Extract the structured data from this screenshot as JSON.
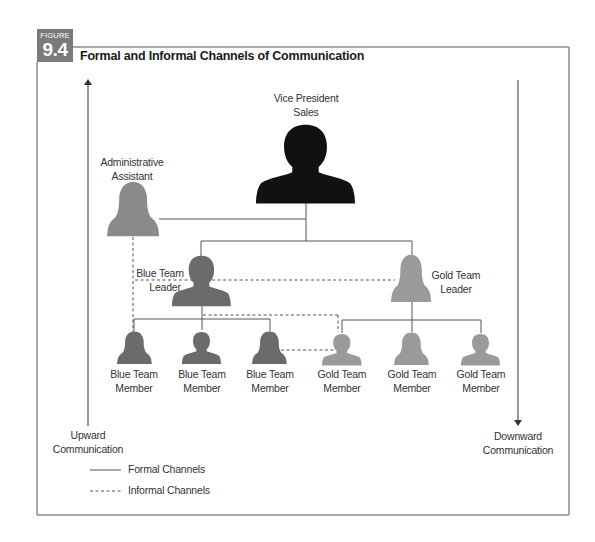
{
  "figure": {
    "label": "FIGURE",
    "number": "9.4",
    "title": "Formal and Informal Channels of Communication"
  },
  "colors": {
    "vp": "#111111",
    "blue_team": "#6b6b6b",
    "gold_team": "#9a9a9a",
    "admin": "#8a8a8a",
    "badge": "#7a7a7a",
    "frame": "#8c8c8c",
    "line": "#555555"
  },
  "nodes": {
    "vp": {
      "line1": "Vice President",
      "line2": "Sales"
    },
    "admin": {
      "line1": "Administrative",
      "line2": "Assistant"
    },
    "blue_leader": {
      "line1": "Blue Team",
      "line2": "Leader"
    },
    "gold_leader": {
      "line1": "Gold Team",
      "line2": "Leader"
    },
    "members": [
      {
        "line1": "Blue Team",
        "line2": "Member"
      },
      {
        "line1": "Blue Team",
        "line2": "Member"
      },
      {
        "line1": "Blue Team",
        "line2": "Member"
      },
      {
        "line1": "Gold Team",
        "line2": "Member"
      },
      {
        "line1": "Gold Team",
        "line2": "Member"
      },
      {
        "line1": "Gold Team",
        "line2": "Member"
      }
    ]
  },
  "arrows": {
    "upward": {
      "line1": "Upward",
      "line2": "Communication"
    },
    "downward": {
      "line1": "Downward",
      "line2": "Communication"
    }
  },
  "legend": {
    "formal": "Formal Channels",
    "informal": "Informal Channels"
  }
}
